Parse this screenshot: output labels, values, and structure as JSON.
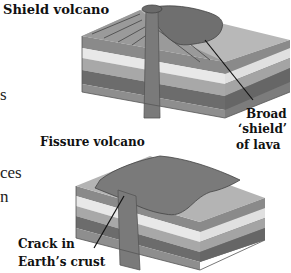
{
  "diagram": {
    "shield": {
      "title": "Shield volcano",
      "callout_line1": "Broad",
      "callout_line2": "‘shield’",
      "callout_line3": "of lava"
    },
    "fissure": {
      "title": "Fissure volcano",
      "callout_line1": "Crack in",
      "callout_line2": "Earth’s crust"
    },
    "cropped_body_text": [
      "s",
      "ces",
      "n"
    ],
    "colors": {
      "layer_top": "#8d8d8d",
      "layer_light": "#e6e6e6",
      "layer_mid": "#a6a6a6",
      "layer_dark": "#6a6a6a",
      "lava": "#7a7a7a",
      "ground": "#b4b4b4"
    }
  }
}
